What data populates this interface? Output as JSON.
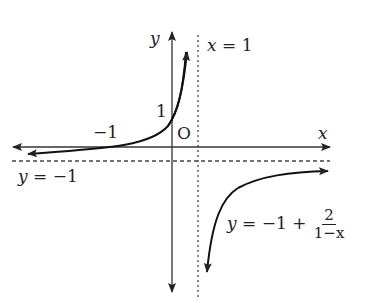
{
  "diagram": {
    "type": "function-graph",
    "axes": {
      "x_label": "x",
      "y_label": "y",
      "origin_label": "O"
    },
    "tick_labels": {
      "x_neg_one": "−1",
      "y_one": "1"
    },
    "asymptotes": {
      "vertical": {
        "label": "x = 1",
        "lhs": "x",
        "rhs": "1"
      },
      "horizontal": {
        "label": "y = −1",
        "lhs": "y",
        "rhs": "−1"
      }
    },
    "function": {
      "label": "y = −1 + 2/(1−x)",
      "lhs": "y",
      "rhs_prefix": "−1 +",
      "numerator": "2",
      "denominator": "1−x"
    },
    "colors": {
      "ink": "#222222",
      "background": "#ffffff"
    }
  }
}
